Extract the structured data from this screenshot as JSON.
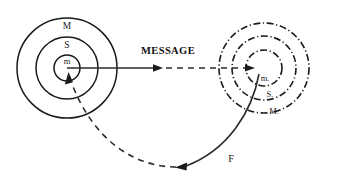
{
  "diagram": {
    "background_color": "#ffffff",
    "stroke_color": "#1a1a1a",
    "left_system": {
      "name": "sender-system",
      "center_x": 67,
      "center_y": 68,
      "line_style": "solid",
      "rings": [
        {
          "label": "M",
          "radius": 50,
          "label_x": 67,
          "label_y": 27
        },
        {
          "label": "S",
          "radius": 31,
          "label_x": 67,
          "label_y": 46
        },
        {
          "label": "m",
          "radius": 13,
          "label_x": 67,
          "label_y": 62
        }
      ]
    },
    "right_system": {
      "name": "receiver-system",
      "center_x": 264,
      "center_y": 68,
      "line_style": "dash-dot",
      "rings": [
        {
          "label": "M.",
          "radius": 45,
          "label_x": 274,
          "label_y": 112
        },
        {
          "label": "S.",
          "radius": 32,
          "label_x": 270,
          "label_y": 95
        },
        {
          "label": "m.",
          "radius": 18,
          "label_x": 265,
          "label_y": 79
        }
      ]
    },
    "message_arrow": {
      "label": "MESSAGE",
      "label_x": 168,
      "label_y": 52,
      "solid_from_x": 67,
      "solid_to_x": 163,
      "dashed_to_x": 252,
      "y": 68
    },
    "feedback_arrow": {
      "label": "F",
      "label_x": 231,
      "label_y": 160,
      "description": "solid curve from receiver sphere sweeping down-left, becoming dashed and returning up into sender inner sphere"
    }
  }
}
